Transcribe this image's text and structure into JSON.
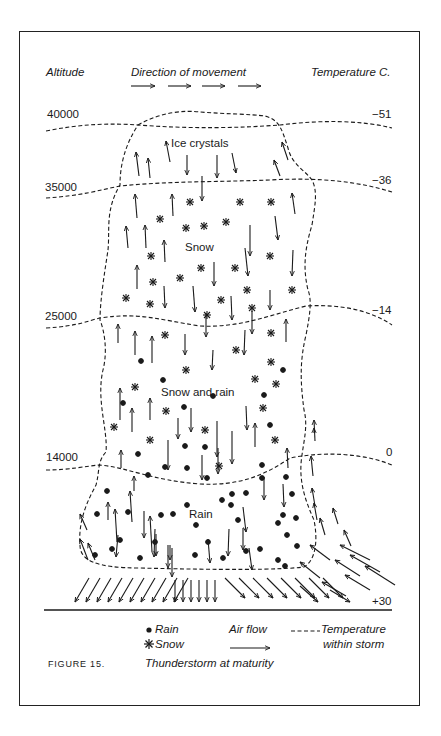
{
  "header": {
    "altitude_label": "Altitude",
    "direction_label": "Direction of movement",
    "temperature_label": "Temperature C."
  },
  "altitudes": [
    "40000",
    "35000",
    "25000",
    "14000"
  ],
  "temperatures": [
    "−51",
    "−36",
    "−14",
    "0",
    "+30"
  ],
  "zones": {
    "ice": "Ice crystals",
    "snow": "Snow",
    "snow_rain": "Snow and rain",
    "rain": "Rain"
  },
  "legend": {
    "rain": "Rain",
    "snow": "Snow",
    "air_flow": "Air flow",
    "temperature_line": "Temperature",
    "temperature_line_2": "within storm"
  },
  "figure": {
    "number": "FIGURE 15.",
    "caption": "Thunderstorm at maturity"
  }
}
